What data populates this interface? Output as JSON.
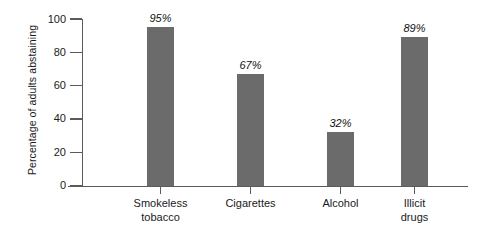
{
  "chart_data": {
    "type": "bar",
    "title": "",
    "subtitle": "",
    "xlabel": "",
    "ylabel": "Percentage of adults abstaining",
    "ylim": [
      0,
      100
    ],
    "yticks": [
      0,
      20,
      40,
      60,
      80,
      100
    ],
    "ytick_labels": [
      "0",
      "20",
      "40",
      "60",
      "80",
      "100"
    ],
    "grid": false,
    "legend": false,
    "legend_position": "none",
    "bar_color": "#6b6b6b",
    "axis_color": "#5b5b5b",
    "background_color": "#ffffff",
    "value_label_style": "italic",
    "categories": [
      "Smokeless tobacco",
      "Cigarettes",
      "Alcohol",
      "Illicit drugs"
    ],
    "category_lines": [
      [
        "Smokeless",
        "tobacco"
      ],
      [
        "Cigarettes"
      ],
      [
        "Alcohol"
      ],
      [
        "Illicit",
        "drugs"
      ]
    ],
    "values": [
      95,
      67,
      32,
      89
    ],
    "value_labels": [
      "95%",
      "67%",
      "32%",
      "89%"
    ],
    "series": [
      {
        "name": "Percentage of adults abstaining",
        "values": [
          95,
          67,
          32,
          89
        ]
      }
    ]
  }
}
